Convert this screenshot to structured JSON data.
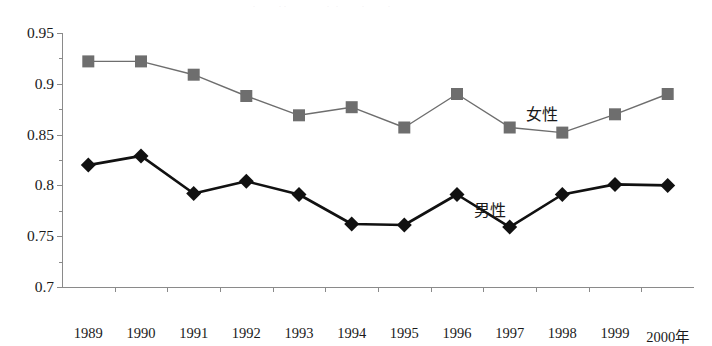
{
  "chart_data": {
    "type": "line",
    "title": "",
    "xlabel": "",
    "ylabel": "",
    "x_axis_suffix": "年",
    "categories": [
      "1989",
      "1990",
      "1991",
      "1992",
      "1993",
      "1994",
      "1995",
      "1996",
      "1997",
      "1998",
      "1999",
      "2000"
    ],
    "x_tick_labels": [
      "1989",
      "1990",
      "1991",
      "1992",
      "1993",
      "1994",
      "1995",
      "1996",
      "1997",
      "1998",
      "1999",
      "2000年"
    ],
    "ylim": [
      0.7,
      0.95
    ],
    "y_tick_labels": [
      "0.95",
      "0.9",
      "0.85",
      "0.8",
      "0.75",
      "0.7"
    ],
    "y_tick_values": [
      0.95,
      0.9,
      0.85,
      0.8,
      0.75,
      0.7
    ],
    "y_minor_tick_values": [
      0.925,
      0.875,
      0.825,
      0.775,
      0.725
    ],
    "grid": false,
    "legend_position": "inline-annotation",
    "series": [
      {
        "name": "女性",
        "marker": "square",
        "color": "#6e6e6e",
        "line_width": 1.4,
        "label_x_category": "1998",
        "values": [
          0.922,
          0.922,
          0.909,
          0.888,
          0.869,
          0.877,
          0.857,
          0.89,
          0.857,
          0.852,
          0.87,
          0.89
        ]
      },
      {
        "name": "男性",
        "marker": "diamond",
        "color": "#111111",
        "line_width": 2.6,
        "label_x_category": "1997",
        "values": [
          0.82,
          0.829,
          0.792,
          0.804,
          0.791,
          0.762,
          0.761,
          0.791,
          0.759,
          0.791,
          0.801,
          0.8
        ]
      }
    ],
    "annotations": [
      {
        "text": "女性",
        "series": "女性"
      },
      {
        "text": "男性",
        "series": "男性"
      }
    ]
  },
  "title_remnant": "— —— · —  ··  — —  ·   ·    —   ·  —  ·",
  "caption_remnant": "· —— · — ·· ——— · — ··· —— ·"
}
